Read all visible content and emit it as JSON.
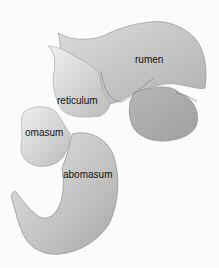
{
  "diagram": {
    "title": "",
    "parts": [
      {
        "id": "rumen",
        "label": "rumen"
      },
      {
        "id": "reticulum",
        "label": "reticulum"
      },
      {
        "id": "omasum",
        "label": "omasum"
      },
      {
        "id": "abomasum",
        "label": "abomasum"
      }
    ],
    "colors": {
      "fill_light": "#e2e2e2",
      "fill_mid": "#c8c8c8",
      "fill_dark": "#a9a9a9",
      "outline": "#8c8c8c",
      "text": "#111111"
    }
  }
}
